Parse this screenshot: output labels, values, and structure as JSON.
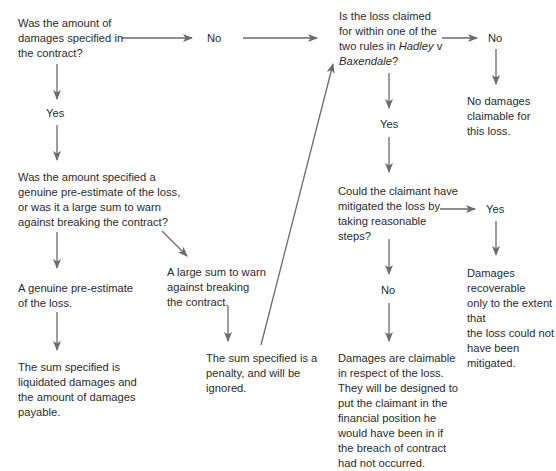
{
  "diagram": {
    "type": "flowchart",
    "colors": {
      "arrow": "#6b6b6b",
      "text": "#2b2b2b",
      "background": "#ffffff"
    },
    "nodes": {
      "q_specified": "Was the amount of damages specified in the contract?",
      "q_specified_lines": [
        "Was the amount of",
        "damages specified in",
        "the contract?"
      ],
      "no_specified": "No",
      "yes_specified": "Yes",
      "q_hadley_lines": [
        "Is the loss claimed",
        "for within one of the",
        "two rules in "
      ],
      "q_hadley_italic1": "Hadley",
      "q_hadley_v": " v",
      "q_hadley_italic2": "Baxendale",
      "q_hadley_q": "?",
      "no_hadley": "No",
      "no_damages_lines": [
        "No damages",
        "claimable for",
        "this loss."
      ],
      "yes_hadley": "Yes",
      "q_genuine_lines": [
        "Was the amount specified a",
        "genuine pre-estimate of the loss,",
        "or was it a large sum to warn",
        "against breaking the contract?"
      ],
      "genuine_lines": [
        "A genuine pre-estimate",
        "of the loss."
      ],
      "large_sum_lines": [
        "A large sum to warn",
        "against breaking",
        "the contract."
      ],
      "liquidated_lines": [
        "The sum specified is",
        "liquidated damages and",
        "the amount of damages",
        "payable."
      ],
      "penalty_lines": [
        "The sum specified is a",
        "penalty, and will be",
        "ignored."
      ],
      "q_mitigate_lines": [
        "Could the claimant have",
        "mitigated the loss by",
        "taking reasonable",
        "steps?"
      ],
      "yes_mitigate": "Yes",
      "recoverable_lines": [
        "Damages recoverable",
        "only to the extent that",
        "the loss could not",
        "have been mitigated."
      ],
      "no_mitigate": "No",
      "claimable_lines": [
        "Damages are claimable",
        "in respect of the loss.",
        "They will be designed to",
        "put the claimant in the",
        "financial position he",
        "would have been in if",
        "the breach of contract",
        "had not occurred."
      ]
    }
  }
}
